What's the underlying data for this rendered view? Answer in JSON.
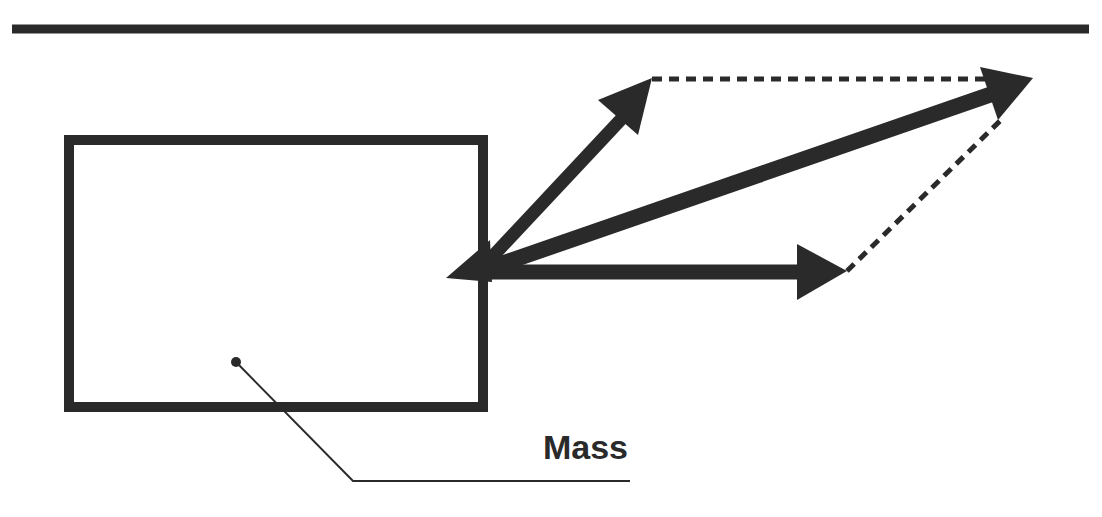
{
  "diagram": {
    "type": "vector-addition-parallelogram",
    "colors": {
      "stroke": "#2a2a2a",
      "background": "#ffffff"
    },
    "top_rule": {
      "x1": 12,
      "y1": 29,
      "x2": 1089,
      "y2": 29,
      "width": 9
    },
    "mass_box": {
      "x": 69,
      "y": 140,
      "width": 414,
      "height": 267,
      "stroke_width": 10
    },
    "origin": {
      "x": 478,
      "y": 272
    },
    "vectors": [
      {
        "name": "force-1",
        "direction": "up-right",
        "tip": {
          "x": 652,
          "y": 78
        }
      },
      {
        "name": "force-2",
        "direction": "right",
        "tip": {
          "x": 847,
          "y": 271
        }
      },
      {
        "name": "resultant",
        "direction": "diagonal",
        "tip": {
          "x": 1033,
          "y": 78
        }
      }
    ],
    "dashed_lines": [
      {
        "from": {
          "x": 652,
          "y": 79
        },
        "to": {
          "x": 990,
          "y": 79
        }
      },
      {
        "from": {
          "x": 847,
          "y": 271
        },
        "to": {
          "x": 1003,
          "y": 118
        }
      }
    ],
    "center_of_mass": {
      "x": 236,
      "y": 362
    },
    "leader_line": {
      "points": [
        [
          236,
          362
        ],
        [
          353,
          481
        ],
        [
          630,
          481
        ]
      ]
    },
    "label": {
      "text": "Mass",
      "x": 628,
      "y": 459
    }
  }
}
